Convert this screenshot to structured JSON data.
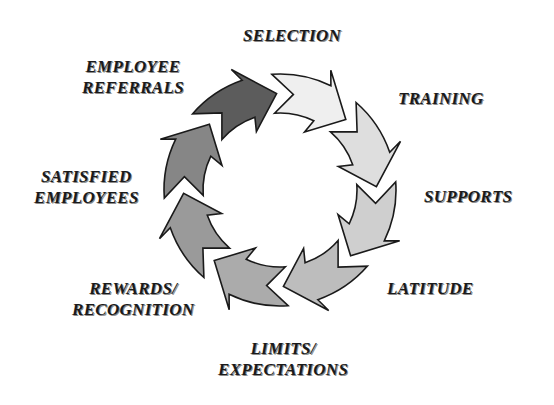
{
  "diagram": {
    "type": "cycle",
    "direction": "clockwise",
    "center": [
      280,
      190
    ],
    "outer_radius": 116,
    "inner_radius": 77,
    "stroke": "#1a1a1a",
    "steps": [
      {
        "id": "employee-referrals",
        "lines": [
          "EMPLOYEE",
          "REFERRALS"
        ],
        "fill": "#5c5c5c",
        "tip_angle": -92
      },
      {
        "id": "selection",
        "lines": [
          "SELECTION"
        ],
        "fill": "#efefef",
        "tip_angle": -47
      },
      {
        "id": "training",
        "lines": [
          "TRAINING"
        ],
        "fill": "#dedede",
        "tip_angle": -2
      },
      {
        "id": "supports",
        "lines": [
          "SUPPORTS"
        ],
        "fill": "#cfcfcf",
        "tip_angle": 43
      },
      {
        "id": "latitude",
        "lines": [
          "LATITUDE"
        ],
        "fill": "#bdbdbd",
        "tip_angle": 88
      },
      {
        "id": "limits-expectations",
        "lines": [
          "LIMITS/",
          "EXPECTATIONS"
        ],
        "fill": "#ababab",
        "tip_angle": 133
      },
      {
        "id": "rewards-recognition",
        "lines": [
          "REWARDS/",
          "RECOGNITION"
        ],
        "fill": "#9a9a9a",
        "tip_angle": 178
      },
      {
        "id": "satisfied-employees",
        "lines": [
          "SATISFIED",
          "EMPLOYEES"
        ],
        "fill": "#868686",
        "tip_angle": 223
      }
    ]
  },
  "labels": {
    "employee_referrals": {
      "line1": "EMPLOYEE",
      "line2": "REFERRALS"
    },
    "selection": {
      "line1": "SELECTION"
    },
    "training": {
      "line1": "TRAINING"
    },
    "supports": {
      "line1": "SUPPORTS"
    },
    "latitude": {
      "line1": "LATITUDE"
    },
    "limits_expectations": {
      "line1": "LIMITS/",
      "line2": "EXPECTATIONS"
    },
    "rewards_recognition": {
      "line1": "REWARDS/",
      "line2": "RECOGNITION"
    },
    "satisfied_employees": {
      "line1": "SATISFIED",
      "line2": "EMPLOYEES"
    }
  }
}
